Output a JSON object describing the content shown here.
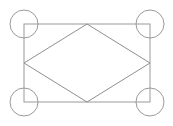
{
  "figure": {
    "type": "line-drawing",
    "canvas": {
      "width": 173,
      "height": 126,
      "background_color": "#ffffff"
    },
    "style": {
      "stroke_color": "#9a9a9a",
      "diamond_stroke_color": "#8f8f8f",
      "circle_stroke_color": "#9a9a9a",
      "stroke_width": 1,
      "fill": "none"
    },
    "shapes": {
      "rectangle": {
        "name": "outer-rectangle",
        "x": 24,
        "y": 24,
        "width": 126,
        "height": 78,
        "corners": [
          {
            "label": "top-left",
            "x": 24,
            "y": 24
          },
          {
            "label": "top-right",
            "x": 150,
            "y": 24
          },
          {
            "label": "bottom-right",
            "x": 150,
            "y": 102
          },
          {
            "label": "bottom-left",
            "x": 24,
            "y": 102
          }
        ]
      },
      "diamond": {
        "name": "inscribed-diamond",
        "points": "87,24 150,63 87,102 24,63",
        "vertices": [
          {
            "label": "top",
            "x": 87,
            "y": 24
          },
          {
            "label": "right",
            "x": 150,
            "y": 63
          },
          {
            "label": "bottom",
            "x": 87,
            "y": 102
          },
          {
            "label": "left",
            "x": 24,
            "y": 63
          }
        ]
      },
      "circles": [
        {
          "label": "top-left-circle",
          "cx": 24,
          "cy": 24,
          "r": 14
        },
        {
          "label": "top-right-circle",
          "cx": 150,
          "cy": 24,
          "r": 14
        },
        {
          "label": "bottom-left-circle",
          "cx": 24,
          "cy": 102,
          "r": 14
        },
        {
          "label": "bottom-right-circle",
          "cx": 150,
          "cy": 102,
          "r": 14
        }
      ]
    }
  }
}
